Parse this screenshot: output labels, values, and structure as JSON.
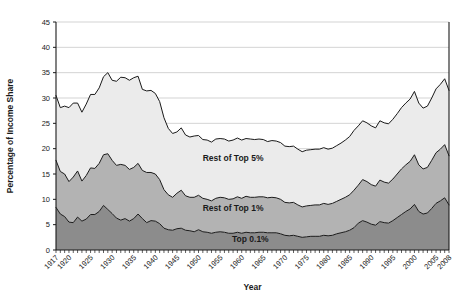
{
  "chart_data": {
    "type": "area",
    "stacked": true,
    "title": "",
    "xlabel": "Year",
    "ylabel": "Percentage of Income Share",
    "xlim": [
      1917,
      2008
    ],
    "ylim": [
      0,
      45
    ],
    "ytick_step": 5,
    "yticks": [
      0,
      5,
      10,
      15,
      20,
      25,
      30,
      35,
      40,
      45
    ],
    "xticks": [
      1917,
      1920,
      1925,
      1930,
      1935,
      1940,
      1945,
      1950,
      1955,
      1960,
      1965,
      1970,
      1975,
      1980,
      1985,
      1990,
      1995,
      2000,
      2005,
      2008
    ],
    "grid": "horizontal",
    "legend_position": "inline-annotations",
    "x": [
      1917,
      1918,
      1919,
      1920,
      1921,
      1922,
      1923,
      1924,
      1925,
      1926,
      1927,
      1928,
      1929,
      1930,
      1931,
      1932,
      1933,
      1934,
      1935,
      1936,
      1937,
      1938,
      1939,
      1940,
      1941,
      1942,
      1943,
      1944,
      1945,
      1946,
      1947,
      1948,
      1949,
      1950,
      1951,
      1952,
      1953,
      1954,
      1955,
      1956,
      1957,
      1958,
      1959,
      1960,
      1961,
      1962,
      1963,
      1964,
      1965,
      1966,
      1967,
      1968,
      1969,
      1970,
      1971,
      1972,
      1973,
      1974,
      1975,
      1976,
      1977,
      1978,
      1979,
      1980,
      1981,
      1982,
      1983,
      1984,
      1985,
      1986,
      1987,
      1988,
      1989,
      1990,
      1991,
      1992,
      1993,
      1994,
      1995,
      1996,
      1997,
      1998,
      1999,
      2000,
      2001,
      2002,
      2003,
      2004,
      2005,
      2006,
      2007,
      2008
    ],
    "series": [
      {
        "name": "Top 0.1%",
        "color": "#8c8c8c",
        "values": [
          8.4,
          7.1,
          6.6,
          5.5,
          5.4,
          6.5,
          5.7,
          6.1,
          7.0,
          7.0,
          7.6,
          8.8,
          8.0,
          7.2,
          6.3,
          5.9,
          6.2,
          5.7,
          6.2,
          7.1,
          6.2,
          5.4,
          5.8,
          5.7,
          5.2,
          4.3,
          4.0,
          3.9,
          4.2,
          4.3,
          3.9,
          3.8,
          3.6,
          4.0,
          3.6,
          3.5,
          3.3,
          3.5,
          3.6,
          3.5,
          3.3,
          3.3,
          3.5,
          3.3,
          3.5,
          3.4,
          3.4,
          3.5,
          3.5,
          3.4,
          3.4,
          3.4,
          3.2,
          2.9,
          2.8,
          2.9,
          2.7,
          2.5,
          2.6,
          2.7,
          2.7,
          2.7,
          2.9,
          2.8,
          2.9,
          3.2,
          3.4,
          3.6,
          3.9,
          4.4,
          5.3,
          5.8,
          5.5,
          5.1,
          4.9,
          5.6,
          5.4,
          5.3,
          5.8,
          6.4,
          7.0,
          7.6,
          8.1,
          9.0,
          7.6,
          7.1,
          7.3,
          8.2,
          9.2,
          9.7,
          10.3,
          8.9
        ]
      },
      {
        "name": "Rest of Top 1%",
        "color": "#b3b3b3",
        "values": [
          9.3,
          8.4,
          8.4,
          8.0,
          9.0,
          9.1,
          7.9,
          8.6,
          9.2,
          9.1,
          9.5,
          10.0,
          11.0,
          10.5,
          10.4,
          11.0,
          10.5,
          10.2,
          10.1,
          10.0,
          9.5,
          9.9,
          9.5,
          9.3,
          8.7,
          7.6,
          6.9,
          6.5,
          7.0,
          7.5,
          6.8,
          6.6,
          6.8,
          6.8,
          6.6,
          6.5,
          6.4,
          6.7,
          6.8,
          6.8,
          6.7,
          6.8,
          7.0,
          6.9,
          7.1,
          7.0,
          7.0,
          7.0,
          7.0,
          6.9,
          7.0,
          6.9,
          6.8,
          6.5,
          6.5,
          6.5,
          6.2,
          6.0,
          6.1,
          6.1,
          6.2,
          6.2,
          6.3,
          6.2,
          6.3,
          6.4,
          6.6,
          6.8,
          7.0,
          7.4,
          7.5,
          8.1,
          8.0,
          7.8,
          7.7,
          8.2,
          8.0,
          7.9,
          8.2,
          8.6,
          9.0,
          9.2,
          9.4,
          9.8,
          9.2,
          8.9,
          9.0,
          9.5,
          10.0,
          10.2,
          10.5,
          9.7
        ]
      },
      {
        "name": "Rest of Top 5%",
        "color": "#ebebeb",
        "values": [
          12.8,
          12.6,
          13.4,
          14.6,
          14.6,
          13.4,
          13.6,
          14.1,
          14.5,
          14.6,
          14.9,
          15.4,
          16.0,
          15.8,
          16.6,
          17.2,
          17.3,
          17.6,
          17.7,
          17.2,
          16.0,
          16.1,
          16.2,
          15.9,
          15.4,
          14.2,
          13.1,
          12.6,
          12.1,
          12.3,
          12.0,
          11.9,
          12.1,
          11.8,
          11.6,
          11.7,
          11.6,
          11.7,
          11.6,
          11.6,
          11.5,
          11.6,
          11.6,
          11.5,
          11.4,
          11.5,
          11.4,
          11.4,
          11.3,
          11.1,
          11.2,
          11.2,
          11.2,
          11.1,
          11.1,
          11.1,
          11.0,
          10.9,
          11.0,
          11.0,
          11.0,
          11.0,
          11.0,
          10.9,
          10.9,
          11.0,
          11.1,
          11.3,
          11.5,
          11.8,
          11.7,
          11.6,
          11.6,
          11.6,
          11.5,
          11.7,
          11.7,
          11.7,
          11.8,
          11.9,
          12.1,
          12.2,
          12.3,
          12.5,
          12.2,
          12.0,
          12.1,
          12.3,
          12.6,
          12.8,
          13.0,
          12.9
        ]
      }
    ],
    "annotations": [
      {
        "text": "Rest of Top 5%",
        "x": 1958,
        "y": 17.5
      },
      {
        "text": "Rest of Top 1%",
        "x": 1958,
        "y": 7.6
      },
      {
        "text": "Top 0.1%",
        "x": 1962,
        "y": 1.6
      }
    ]
  },
  "axes": {
    "ylabel": "Percentage of Income Share",
    "xlabel": "Year",
    "ytick_labels": [
      "0",
      "5",
      "10",
      "15",
      "20",
      "25",
      "30",
      "35",
      "40",
      "45"
    ],
    "xtick_labels": [
      "1917",
      "1920",
      "1925",
      "1930",
      "1935",
      "1940",
      "1945",
      "1950",
      "1955",
      "1960",
      "1965",
      "1970",
      "1975",
      "1980",
      "1985",
      "1990",
      "1995",
      "2000",
      "2005",
      "2008"
    ]
  },
  "colors": {
    "top_tenth_pct": "#8c8c8c",
    "rest_of_top_1": "#b3b3b3",
    "rest_of_top_5": "#ebebeb",
    "line": "#1a1a1a",
    "grid": "#c8c8c8",
    "background": "#ffffff"
  }
}
